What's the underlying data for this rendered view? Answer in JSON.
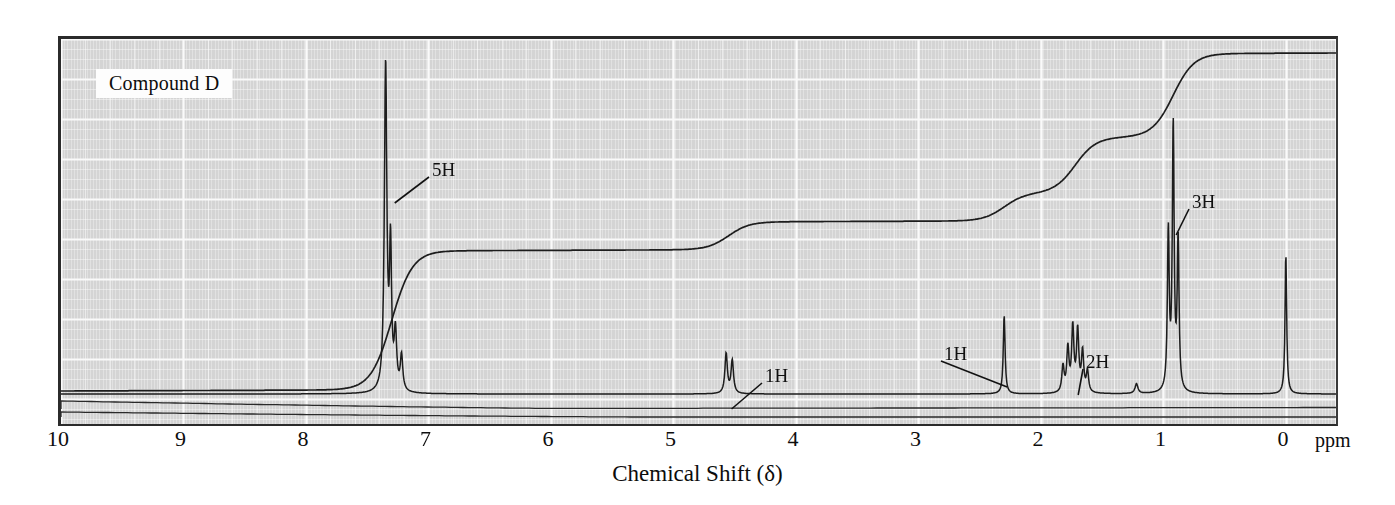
{
  "figure": {
    "compound_label": "Compound D",
    "axis_title": "Chemical Shift (δ)",
    "unit_label": "ppm",
    "background_color": "#d4d4d4",
    "grid_color": "#f4f4f4",
    "trace_color": "#1d1d1d"
  },
  "chart_data": {
    "type": "line",
    "title": "Compound D",
    "subtitle": "",
    "xlabel": "Chemical Shift (δ)",
    "ylabel": "",
    "xunit": "ppm",
    "xlim": [
      10,
      -0.45
    ],
    "ylim": [
      0,
      1
    ],
    "x_tick_labels": [
      "10",
      "9",
      "8",
      "7",
      "6",
      "5",
      "4",
      "3",
      "2",
      "1",
      "0"
    ],
    "x_ticks": [
      10,
      9,
      8,
      7,
      6,
      5,
      4,
      3,
      2,
      1,
      0
    ],
    "grid": true,
    "grid_minor": true,
    "legend": "none",
    "annotations": [
      {
        "label": "5H",
        "shift": 7.3,
        "text_x": 432,
        "text_y": 160
      },
      {
        "label": "1H",
        "shift": 4.55,
        "text_x": 765,
        "text_y": 366
      },
      {
        "label": "1H",
        "shift": 2.3,
        "text_x": 944,
        "text_y": 344
      },
      {
        "label": "2H",
        "shift": 1.72,
        "text_x": 1086,
        "text_y": 352
      },
      {
        "label": "3H",
        "shift": 0.92,
        "text_x": 1192,
        "text_y": 192
      }
    ],
    "peaks": [
      {
        "shift": 7.35,
        "height": 0.945,
        "width": 0.012,
        "integration": "5H",
        "multiplicity": "m",
        "assignment": "aromatic"
      },
      {
        "shift": 7.31,
        "height": 0.4,
        "width": 0.01,
        "integration": "",
        "multiplicity": "m",
        "assignment": "aromatic"
      },
      {
        "shift": 7.27,
        "height": 0.16,
        "width": 0.012,
        "integration": "",
        "multiplicity": "m",
        "assignment": "aromatic"
      },
      {
        "shift": 7.22,
        "height": 0.1,
        "width": 0.012,
        "integration": "",
        "multiplicity": "m",
        "assignment": "aromatic"
      },
      {
        "shift": 4.57,
        "height": 0.115,
        "width": 0.012,
        "integration": "1H",
        "multiplicity": "t",
        "assignment": "methine"
      },
      {
        "shift": 4.52,
        "height": 0.095,
        "width": 0.012,
        "integration": "",
        "multiplicity": "t",
        "assignment": "methine"
      },
      {
        "shift": 2.3,
        "height": 0.225,
        "width": 0.009,
        "integration": "1H",
        "multiplicity": "s",
        "assignment": "OH"
      },
      {
        "shift": 1.82,
        "height": 0.075,
        "width": 0.011,
        "integration": "2H",
        "multiplicity": "m",
        "assignment": "methylene"
      },
      {
        "shift": 1.78,
        "height": 0.125,
        "width": 0.011,
        "integration": "",
        "multiplicity": "m",
        "assignment": "methylene"
      },
      {
        "shift": 1.74,
        "height": 0.185,
        "width": 0.011,
        "integration": "",
        "multiplicity": "m",
        "assignment": "methylene"
      },
      {
        "shift": 1.7,
        "height": 0.175,
        "width": 0.011,
        "integration": "",
        "multiplicity": "m",
        "assignment": "methylene"
      },
      {
        "shift": 1.66,
        "height": 0.115,
        "width": 0.011,
        "integration": "",
        "multiplicity": "m",
        "assignment": "methylene"
      },
      {
        "shift": 1.62,
        "height": 0.06,
        "width": 0.011,
        "integration": "",
        "multiplicity": "m",
        "assignment": "methylene"
      },
      {
        "shift": 1.22,
        "height": 0.028,
        "width": 0.014,
        "integration": "",
        "multiplicity": "br",
        "assignment": "impurity"
      },
      {
        "shift": 0.96,
        "height": 0.455,
        "width": 0.009,
        "integration": "3H",
        "multiplicity": "t",
        "assignment": "methyl"
      },
      {
        "shift": 0.92,
        "height": 0.76,
        "width": 0.009,
        "integration": "",
        "multiplicity": "t",
        "assignment": "methyl"
      },
      {
        "shift": 0.88,
        "height": 0.43,
        "width": 0.009,
        "integration": "",
        "multiplicity": "t",
        "assignment": "methyl"
      },
      {
        "shift": 0.0,
        "height": 0.4,
        "width": 0.008,
        "integration": "",
        "multiplicity": "s",
        "assignment": "TMS"
      }
    ],
    "integration_steps": [
      {
        "shift": 7.3,
        "protons": 5,
        "label": "5H"
      },
      {
        "shift": 4.55,
        "protons": 1,
        "label": "1H"
      },
      {
        "shift": 2.3,
        "protons": 1,
        "label": "1H"
      },
      {
        "shift": 1.72,
        "protons": 2,
        "label": "2H"
      },
      {
        "shift": 0.92,
        "protons": 3,
        "label": "3H"
      }
    ]
  }
}
